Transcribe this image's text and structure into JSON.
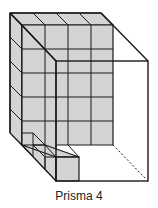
{
  "figure": {
    "caption": "Prisma 4",
    "colors": {
      "cube_fill": "#d4d4d4",
      "line": "#1a1a1a",
      "background": "#ffffff"
    },
    "dimensions": {
      "width_units": 4,
      "height_units": 5,
      "depth_units": 2
    }
  }
}
